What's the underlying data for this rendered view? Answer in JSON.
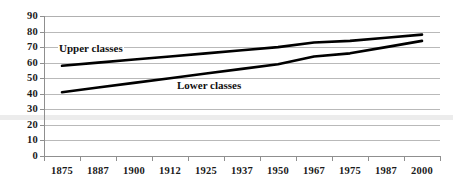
{
  "chart_data": {
    "type": "line",
    "title": "",
    "subtitle": "",
    "xlabel": "",
    "ylabel": "",
    "x": [
      "1875",
      "1887",
      "1900",
      "1912",
      "1925",
      "1937",
      "1950",
      "1967",
      "1975",
      "1987",
      "2000"
    ],
    "categories": [
      "1875",
      "1887",
      "1900",
      "1912",
      "1925",
      "1937",
      "1950",
      "1967",
      "1975",
      "1987",
      "2000"
    ],
    "yticks": [
      0,
      10,
      20,
      30,
      40,
      50,
      60,
      70,
      80,
      90
    ],
    "ytick_labels": [
      "0",
      "10",
      "20",
      "30",
      "40",
      "50",
      "60",
      "70",
      "80",
      "90"
    ],
    "ylim": [
      0,
      90
    ],
    "grid": true,
    "legend_position": "inline-annotations",
    "series": [
      {
        "name": "Upper classes",
        "color": "#000000",
        "values": [
          58,
          60,
          62,
          64,
          66,
          68,
          70,
          73,
          74,
          76,
          78
        ]
      },
      {
        "name": "Lower classes",
        "color": "#000000",
        "values": [
          41,
          44,
          47,
          50,
          53,
          56,
          59,
          64,
          66,
          70,
          74
        ]
      }
    ],
    "annotations": [
      {
        "text": "Upper classes",
        "series": "Upper classes"
      },
      {
        "text": "Lower classes",
        "series": "Lower classes"
      }
    ]
  },
  "colors": {
    "line": "#000000",
    "grid": "#b9b9b9",
    "axis": "#8f8f8f",
    "text": "#1a1a1a",
    "background": "#ffffff"
  }
}
